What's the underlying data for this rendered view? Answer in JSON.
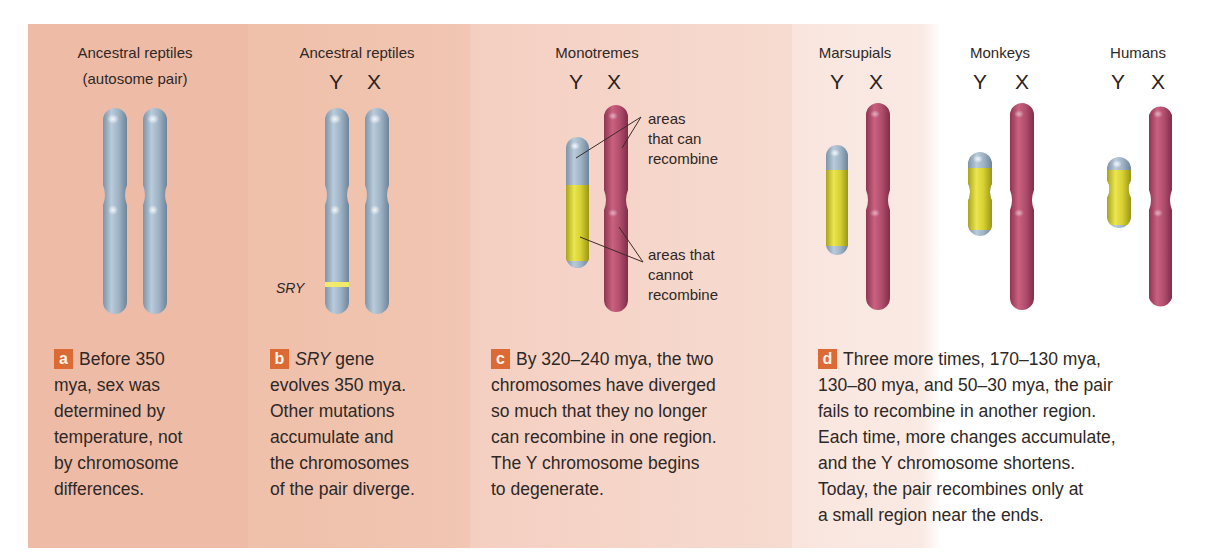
{
  "colors": {
    "panel_a_bg": "#eebca6",
    "panel_b_bg": "#f0c3ae",
    "panel_c_bg": "#f5d5c8",
    "panel_d_bg": "#f9e5de",
    "badge": "#dc6a35",
    "autosome_blue": "#98aec2",
    "y_yellow": "#d8d334",
    "x_pink": "#b54d6e",
    "sry_band": "#f2ea6a"
  },
  "panels": [
    {
      "id": "a",
      "badge": "a",
      "header": "Ancestral reptiles",
      "subheader": "(autosome pair)",
      "caption_lines": [
        "Before 350",
        "mya, sex was",
        "determined by",
        "temperature, not",
        "by chromosome",
        "differences."
      ]
    },
    {
      "id": "b",
      "badge": "b",
      "header": "Ancestral reptiles",
      "y_label": "Y",
      "x_label": "X",
      "gene_label": "SRY",
      "caption_italic": "SRY",
      "caption_first_rest": " gene",
      "caption_lines": [
        "evolves 350 mya.",
        "Other mutations",
        "accumulate and",
        "the chromosomes",
        "of the pair diverge."
      ]
    },
    {
      "id": "c",
      "badge": "c",
      "header": "Monotremes",
      "y_label": "Y",
      "x_label": "X",
      "annotation_recombine": [
        "areas",
        "that can",
        "recombine"
      ],
      "annotation_no_recombine": [
        "areas that",
        "cannot",
        "recombine"
      ],
      "caption_lines": [
        "By 320–240 mya, the two",
        "chromosomes have diverged",
        "so much that they no longer",
        "can recombine in one region.",
        "The Y chromosome begins",
        "to degenerate."
      ]
    },
    {
      "id": "d",
      "badge": "d",
      "groups": [
        {
          "header": "Marsupials",
          "y_label": "Y",
          "x_label": "X"
        },
        {
          "header": "Monkeys",
          "y_label": "Y",
          "x_label": "X"
        },
        {
          "header": "Humans",
          "y_label": "Y",
          "x_label": "X"
        }
      ],
      "caption_lines": [
        "Three more times, 170–130 mya,",
        "130–80 mya, and 50–30 mya, the pair",
        "fails to recombine in another region.",
        "Each time, more changes accumulate,",
        "and the Y chromosome shortens.",
        "Today, the pair recombines only at",
        "a small region near the ends."
      ]
    }
  ]
}
